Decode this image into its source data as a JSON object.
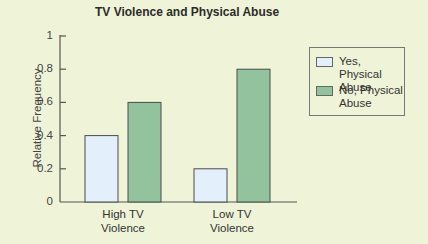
{
  "chart_data": {
    "type": "bar",
    "title": "TV Violence and Physical Abuse",
    "xlabel": "",
    "ylabel": "Relative Frequency",
    "ylim": [
      0,
      1
    ],
    "yticks": [
      0,
      0.2,
      0.4,
      0.6,
      0.8,
      1
    ],
    "ytick_labels": [
      "0",
      "0.2",
      "0.4",
      "0.6",
      "0.8",
      "1"
    ],
    "categories": [
      "High TV Violence",
      "Low TV Violence"
    ],
    "category_labels": [
      [
        "High TV",
        "Violence"
      ],
      [
        "Low TV",
        "Violence"
      ]
    ],
    "series": [
      {
        "name": "Yes, Physical Abuse",
        "values": [
          0.4,
          0.2
        ],
        "color": "#e3f0fb"
      },
      {
        "name": "No, Physical Abuse",
        "values": [
          0.6,
          0.8
        ],
        "color": "#93c39c"
      }
    ],
    "legend": {
      "position": "right",
      "entries": [
        [
          "Yes, Physical",
          "Abuse"
        ],
        [
          "No, Physical",
          "Abuse"
        ]
      ]
    },
    "grid": false
  },
  "colors": {
    "background": "#eff4d8",
    "axis": "#555555",
    "bar_border": "#4a4a4a"
  }
}
